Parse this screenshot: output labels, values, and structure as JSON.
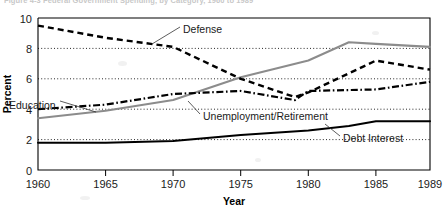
{
  "figure": {
    "caption": "Figure 4-3   Federal Government Spending, by Category, 1960 to 1989"
  },
  "chart_data": {
    "type": "line",
    "title": "",
    "xlabel": "Year",
    "ylabel": "Percent",
    "xlim": [
      1960,
      1989
    ],
    "ylim": [
      0,
      10
    ],
    "xticks": [
      1960,
      1965,
      1970,
      1975,
      1980,
      1985,
      1989
    ],
    "xtick_labels": [
      "1960",
      "1965",
      "1970",
      "1975",
      "1980",
      "1985",
      "1989"
    ],
    "yticks": [
      0,
      2,
      4,
      6,
      8,
      10
    ],
    "ytick_labels": [
      "0",
      "2",
      "4",
      "6",
      "8",
      "10"
    ],
    "gridlines": {
      "horizontal_values": [
        2,
        4,
        6,
        8
      ],
      "style": "dotted",
      "vertical": false
    },
    "legend": "inline-annotations",
    "series": [
      {
        "name": "Defense",
        "label": "Defense",
        "style": "dashed",
        "color": "#000000",
        "x": [
          1960,
          1965,
          1970,
          1975,
          1979,
          1980,
          1985,
          1989
        ],
        "values": [
          9.5,
          8.7,
          8.1,
          6.0,
          4.8,
          5.1,
          7.2,
          6.6
        ]
      },
      {
        "name": "Unemployment/Retirement",
        "label": "Unemployment/Retirement",
        "style": "solid-gray",
        "color": "#8c8c8c",
        "x": [
          1960,
          1965,
          1970,
          1975,
          1980,
          1983,
          1985,
          1989
        ],
        "values": [
          3.4,
          3.9,
          4.6,
          6.1,
          7.2,
          8.4,
          8.3,
          8.1
        ]
      },
      {
        "name": "Education",
        "label": "Education",
        "style": "dash-dot",
        "color": "#000000",
        "x": [
          1960,
          1965,
          1970,
          1975,
          1979,
          1980,
          1985,
          1989
        ],
        "values": [
          4.0,
          4.3,
          5.0,
          5.2,
          4.6,
          5.2,
          5.3,
          5.8
        ]
      },
      {
        "name": "Debt Interest",
        "label": "Debt Interest",
        "style": "solid-black",
        "color": "#000000",
        "x": [
          1960,
          1965,
          1970,
          1975,
          1980,
          1983,
          1985,
          1989
        ],
        "values": [
          1.8,
          1.8,
          1.9,
          2.3,
          2.6,
          2.9,
          3.2,
          3.2
        ]
      }
    ],
    "annotations": [
      {
        "name": "defense-label",
        "text": "Defense",
        "x_px": 183,
        "y_px": 30
      },
      {
        "name": "education-label",
        "text": "Education",
        "x_px": 9,
        "y_px": 106
      },
      {
        "name": "unemployment-retirement-label",
        "text": "Unemployment/Retirement",
        "x_px": 203,
        "y_px": 117
      },
      {
        "name": "debt-interest-label",
        "text": "Debt Interest",
        "x_px": 343,
        "y_px": 139
      }
    ]
  }
}
